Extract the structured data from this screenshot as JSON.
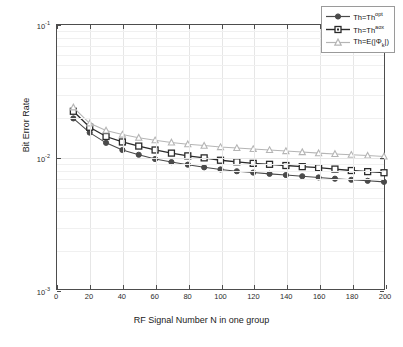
{
  "chart_data": {
    "type": "line",
    "title": "",
    "xlabel": "RF Signal Number N in one group",
    "ylabel": "Bit Error Rate",
    "xlim": [
      0,
      200
    ],
    "ylim": [
      0.001,
      0.1
    ],
    "yscale": "log",
    "grid": true,
    "legend_position": "top-right",
    "xticks": [
      0,
      20,
      40,
      60,
      80,
      100,
      120,
      140,
      160,
      180,
      200
    ],
    "xtick_labels": [
      "0",
      "20",
      "40",
      "60",
      "80",
      "100",
      "120",
      "140",
      "160",
      "180",
      "200"
    ],
    "yticks": [
      0.001,
      0.01,
      0.1
    ],
    "ytick_labels": [
      "10-3",
      "10-2",
      "10-1"
    ],
    "x": [
      10,
      20,
      30,
      40,
      50,
      60,
      70,
      80,
      90,
      100,
      110,
      120,
      130,
      140,
      150,
      160,
      170,
      180,
      190,
      200
    ],
    "series": [
      {
        "name": "Th=Th^opt",
        "marker": "circle",
        "color": "#4a4a4a",
        "values": [
          0.0196,
          0.0153,
          0.0128,
          0.0113,
          0.0104,
          0.00965,
          0.00915,
          0.00875,
          0.00835,
          0.00805,
          0.0078,
          0.00762,
          0.00745,
          0.0073,
          0.00715,
          0.007,
          0.00685,
          0.00672,
          0.0066,
          0.00648
        ]
      },
      {
        "name": "Th=Th^aox",
        "marker": "square",
        "color": "#2a2a2a",
        "values": [
          0.0222,
          0.0168,
          0.0143,
          0.013,
          0.0121,
          0.0113,
          0.0107,
          0.0102,
          0.00985,
          0.00945,
          0.0092,
          0.00895,
          0.0088,
          0.00862,
          0.00845,
          0.0083,
          0.0081,
          0.0079,
          0.00775,
          0.0076
        ]
      },
      {
        "name": "Th=E(|Phi_k|)",
        "marker": "triangle",
        "color": "#b5b5b5",
        "values": [
          0.0238,
          0.018,
          0.0159,
          0.0148,
          0.014,
          0.0134,
          0.0129,
          0.0125,
          0.0122,
          0.0119,
          0.0117,
          0.0115,
          0.0113,
          0.0111,
          0.0109,
          0.0107,
          0.01055,
          0.0104,
          0.01025,
          0.0101
        ]
      }
    ]
  },
  "legend": {
    "entries": [
      {
        "label_prefix": "Th=Th",
        "label_sup": "opt",
        "label_sub": "",
        "label_suffix": ""
      },
      {
        "label_prefix": "Th=Th",
        "label_sup": "aox",
        "label_sub": "",
        "label_suffix": ""
      },
      {
        "label_prefix": "Th=E(|Φ",
        "label_sup": "",
        "label_sub": "k",
        "label_suffix": "|)"
      }
    ]
  },
  "axes": {
    "x_title": "RF Signal Number N in one group",
    "y_title": "Bit Error Rate",
    "y_tick_0_base": "10",
    "y_tick_0_exp": "-1",
    "y_tick_1_base": "10",
    "y_tick_1_exp": "-2",
    "y_tick_2_base": "10",
    "y_tick_2_exp": "-3"
  }
}
